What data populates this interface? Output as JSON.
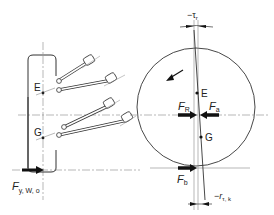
{
  "diagram": {
    "type": "steering axle kinematics (schematic)",
    "labels": {
      "point_E_left": "E",
      "point_G_left": "G",
      "point_E_wheel": "E",
      "point_G_wheel": "G",
      "force_left": "F",
      "force_left_sub": "y, W, o",
      "force_R": "F",
      "force_R_sub": "R",
      "force_a": "F",
      "force_a_sub": "a",
      "force_b": "F",
      "force_b_sub": "b",
      "dim_top": "−τ",
      "dim_top_sub": "r",
      "dim_bottom": "−r",
      "dim_bottom_sub": "τ, k"
    },
    "colors": {
      "line": "#333333",
      "arrow": "#111111",
      "centerline": "#888888"
    }
  }
}
